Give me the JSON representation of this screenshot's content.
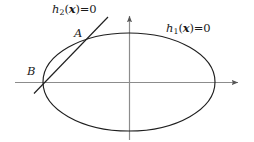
{
  "figure": {
    "background_color": "#ffffff",
    "curve_color": "#1a1a1a",
    "axis_color": "#8c8c8c",
    "text_color": "#1a1a1a",
    "width": 254,
    "height": 142
  },
  "axes": {
    "x_axis": {
      "name": "horizontal-axis",
      "x_start": 15,
      "x_end": 243,
      "y": 82,
      "arrow": "right"
    },
    "y_axis": {
      "name": "vertical-axis",
      "x": 129,
      "y_start": 140,
      "y_end": 11,
      "arrow": "up"
    },
    "origin": [
      129,
      82
    ]
  },
  "ellipse": {
    "label_h": "h",
    "label_sub": "1",
    "label_arg_open": "(",
    "label_arg": "x",
    "label_arg_close": ")",
    "label_rel": "=0",
    "label_full": "h1(x)=0",
    "center": [
      129,
      82
    ],
    "radius_x": 86,
    "radius_y": 49
  },
  "line": {
    "label_h": "h",
    "label_sub": "2",
    "label_arg_open": "(",
    "label_arg": "x",
    "label_arg_close": ")",
    "label_rel": "=0",
    "label_full": "h2(x)=0",
    "p_start": [
      34,
      93
    ],
    "p_end": [
      108,
      17
    ]
  },
  "points": {
    "a": {
      "label": "A",
      "coords": [
        82,
        42
      ]
    },
    "b": {
      "label": "B",
      "coords": [
        40,
        82
      ]
    }
  }
}
